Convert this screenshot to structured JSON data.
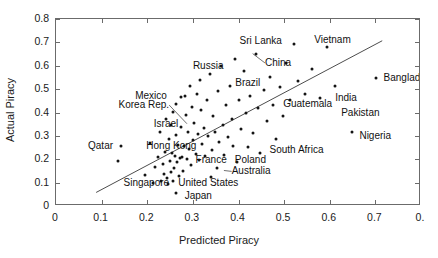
{
  "chart_data": {
    "type": "scatter",
    "title": "",
    "xlabel": "Predicted Piracy",
    "ylabel": "Actual Piracy",
    "xlim": [
      0,
      0.8
    ],
    "ylim": [
      0,
      0.8
    ],
    "xticks": [
      "0",
      "0.1",
      "0.2",
      "0.3",
      "0.4",
      "0.5",
      "0.6",
      "0.7",
      "0."
    ],
    "xtick_values": [
      0,
      0.1,
      0.2,
      0.3,
      0.4,
      0.5,
      0.6,
      0.7,
      0.8
    ],
    "yticks": [
      "0",
      "0.1",
      "0.2",
      "0.3",
      "0.4",
      "0.5",
      "0.6",
      "0.7",
      "0.8"
    ],
    "ytick_values": [
      0,
      0.1,
      0.2,
      0.3,
      0.4,
      0.5,
      0.6,
      0.7,
      0.8
    ],
    "grid": false,
    "legend": "none",
    "marker_color": "#141414",
    "trendline": {
      "label": "fitted-regression-line",
      "color": "#4d4d4d",
      "x0": 0.088,
      "y0": 0.058,
      "x1": 0.715,
      "y1": 0.707
    },
    "points": [
      {
        "x": 0.135,
        "y": 0.193
      },
      {
        "x": 0.143,
        "y": 0.256
      },
      {
        "x": 0.196,
        "y": 0.134
      },
      {
        "x": 0.206,
        "y": 0.269
      },
      {
        "x": 0.212,
        "y": 0.098
      },
      {
        "x": 0.218,
        "y": 0.166
      },
      {
        "x": 0.223,
        "y": 0.208
      },
      {
        "x": 0.228,
        "y": 0.316
      },
      {
        "x": 0.231,
        "y": 0.106
      },
      {
        "x": 0.234,
        "y": 0.178
      },
      {
        "x": 0.236,
        "y": 0.139
      },
      {
        "x": 0.238,
        "y": 0.232
      },
      {
        "x": 0.241,
        "y": 0.372
      },
      {
        "x": 0.243,
        "y": 0.118
      },
      {
        "x": 0.245,
        "y": 0.093
      },
      {
        "x": 0.247,
        "y": 0.287
      },
      {
        "x": 0.249,
        "y": 0.193
      },
      {
        "x": 0.251,
        "y": 0.347
      },
      {
        "x": 0.252,
        "y": 0.145
      },
      {
        "x": 0.254,
        "y": 0.225
      },
      {
        "x": 0.256,
        "y": 0.402
      },
      {
        "x": 0.257,
        "y": 0.108
      },
      {
        "x": 0.259,
        "y": 0.162
      },
      {
        "x": 0.261,
        "y": 0.215
      },
      {
        "x": 0.262,
        "y": 0.438
      },
      {
        "x": 0.263,
        "y": 0.302
      },
      {
        "x": 0.264,
        "y": 0.055
      },
      {
        "x": 0.266,
        "y": 0.188
      },
      {
        "x": 0.268,
        "y": 0.262
      },
      {
        "x": 0.269,
        "y": 0.128
      },
      {
        "x": 0.271,
        "y": 0.205
      },
      {
        "x": 0.273,
        "y": 0.465
      },
      {
        "x": 0.274,
        "y": 0.336
      },
      {
        "x": 0.276,
        "y": 0.211
      },
      {
        "x": 0.278,
        "y": 0.149
      },
      {
        "x": 0.281,
        "y": 0.258
      },
      {
        "x": 0.283,
        "y": 0.471
      },
      {
        "x": 0.285,
        "y": 0.388
      },
      {
        "x": 0.287,
        "y": 0.203
      },
      {
        "x": 0.289,
        "y": 0.318
      },
      {
        "x": 0.291,
        "y": 0.242
      },
      {
        "x": 0.293,
        "y": 0.512
      },
      {
        "x": 0.296,
        "y": 0.175
      },
      {
        "x": 0.298,
        "y": 0.425
      },
      {
        "x": 0.301,
        "y": 0.282
      },
      {
        "x": 0.303,
        "y": 0.355
      },
      {
        "x": 0.306,
        "y": 0.221
      },
      {
        "x": 0.308,
        "y": 0.481
      },
      {
        "x": 0.311,
        "y": 0.308
      },
      {
        "x": 0.313,
        "y": 0.196
      },
      {
        "x": 0.316,
        "y": 0.538
      },
      {
        "x": 0.318,
        "y": 0.412
      },
      {
        "x": 0.321,
        "y": 0.264
      },
      {
        "x": 0.324,
        "y": 0.332
      },
      {
        "x": 0.327,
        "y": 0.212
      },
      {
        "x": 0.331,
        "y": 0.455
      },
      {
        "x": 0.334,
        "y": 0.298
      },
      {
        "x": 0.337,
        "y": 0.565
      },
      {
        "x": 0.339,
        "y": 0.126
      },
      {
        "x": 0.342,
        "y": 0.241
      },
      {
        "x": 0.345,
        "y": 0.385
      },
      {
        "x": 0.348,
        "y": 0.318
      },
      {
        "x": 0.352,
        "y": 0.162
      },
      {
        "x": 0.355,
        "y": 0.492
      },
      {
        "x": 0.358,
        "y": 0.272
      },
      {
        "x": 0.362,
        "y": 0.601
      },
      {
        "x": 0.365,
        "y": 0.348
      },
      {
        "x": 0.368,
        "y": 0.218
      },
      {
        "x": 0.372,
        "y": 0.432
      },
      {
        "x": 0.376,
        "y": 0.295
      },
      {
        "x": 0.381,
        "y": 0.512
      },
      {
        "x": 0.385,
        "y": 0.372
      },
      {
        "x": 0.389,
        "y": 0.258
      },
      {
        "x": 0.392,
        "y": 0.628
      },
      {
        "x": 0.396,
        "y": 0.188
      },
      {
        "x": 0.401,
        "y": 0.455
      },
      {
        "x": 0.405,
        "y": 0.328
      },
      {
        "x": 0.411,
        "y": 0.578
      },
      {
        "x": 0.416,
        "y": 0.398
      },
      {
        "x": 0.421,
        "y": 0.252
      },
      {
        "x": 0.426,
        "y": 0.471
      },
      {
        "x": 0.432,
        "y": 0.312
      },
      {
        "x": 0.438,
        "y": 0.652
      },
      {
        "x": 0.443,
        "y": 0.418
      },
      {
        "x": 0.448,
        "y": 0.225
      },
      {
        "x": 0.455,
        "y": 0.495
      },
      {
        "x": 0.462,
        "y": 0.362
      },
      {
        "x": 0.468,
        "y": 0.552
      },
      {
        "x": 0.475,
        "y": 0.432
      },
      {
        "x": 0.482,
        "y": 0.288
      },
      {
        "x": 0.491,
        "y": 0.508
      },
      {
        "x": 0.498,
        "y": 0.385
      },
      {
        "x": 0.505,
        "y": 0.612
      },
      {
        "x": 0.512,
        "y": 0.452
      },
      {
        "x": 0.522,
        "y": 0.692
      },
      {
        "x": 0.531,
        "y": 0.535
      },
      {
        "x": 0.545,
        "y": 0.478
      },
      {
        "x": 0.562,
        "y": 0.588
      },
      {
        "x": 0.578,
        "y": 0.462
      },
      {
        "x": 0.595,
        "y": 0.682
      },
      {
        "x": 0.612,
        "y": 0.512
      },
      {
        "x": 0.648,
        "y": 0.318
      },
      {
        "x": 0.702,
        "y": 0.548
      }
    ],
    "annotations": [
      {
        "name": "sri-lanka",
        "label": "Sri Lanka",
        "anchor": "right",
        "lx": 0.495,
        "ly": 0.705,
        "px": 0.522,
        "py": 0.692,
        "leader": false
      },
      {
        "name": "vietnam",
        "label": "Vietnam",
        "anchor": "left",
        "lx": 0.566,
        "ly": 0.71,
        "px": 0.595,
        "py": 0.682,
        "leader": false
      },
      {
        "name": "china",
        "label": "China",
        "anchor": "left",
        "lx": 0.458,
        "ly": 0.612,
        "px": 0.431,
        "py": 0.652,
        "leader": true
      },
      {
        "name": "russia",
        "label": "Russia",
        "anchor": "left",
        "lx": 0.3,
        "ly": 0.6,
        "px": 0.362,
        "py": 0.601,
        "leader": false
      },
      {
        "name": "bangladesh",
        "label": "Bangladesh",
        "anchor": "left",
        "lx": 0.718,
        "ly": 0.548,
        "px": 0.702,
        "py": 0.548,
        "leader": false
      },
      {
        "name": "brazil",
        "label": "Brazil",
        "anchor": "left",
        "lx": 0.393,
        "ly": 0.525,
        "px": 0.381,
        "py": 0.548,
        "leader": false
      },
      {
        "name": "mexico",
        "label": "Mexico",
        "anchor": "right",
        "lx": 0.243,
        "ly": 0.472,
        "px": 0.262,
        "py": 0.438,
        "leader": false
      },
      {
        "name": "korea-rep",
        "label": "Korea Rep.",
        "anchor": "right",
        "lx": 0.248,
        "ly": 0.432,
        "px": 0.287,
        "py": 0.352,
        "leader": true
      },
      {
        "name": "guatemala",
        "label": "Guatemala",
        "anchor": "left",
        "lx": 0.498,
        "ly": 0.438,
        "px": 0.482,
        "py": 0.462,
        "leader": false
      },
      {
        "name": "india",
        "label": "India",
        "anchor": "left",
        "lx": 0.612,
        "ly": 0.462,
        "px": 0.595,
        "py": 0.462,
        "leader": false
      },
      {
        "name": "pakistan",
        "label": "Pakistan",
        "anchor": "left",
        "lx": 0.625,
        "ly": 0.398,
        "px": 0.608,
        "py": 0.398,
        "leader": false
      },
      {
        "name": "israel",
        "label": "Israel",
        "anchor": "right",
        "lx": 0.268,
        "ly": 0.352,
        "px": 0.278,
        "py": 0.318,
        "leader": false
      },
      {
        "name": "nigeria",
        "label": "Nigeria",
        "anchor": "left",
        "lx": 0.665,
        "ly": 0.298,
        "px": 0.648,
        "py": 0.318,
        "leader": false
      },
      {
        "name": "qatar",
        "label": "Qatar",
        "anchor": "right",
        "lx": 0.125,
        "ly": 0.258,
        "px": 0.143,
        "py": 0.256,
        "leader": false
      },
      {
        "name": "hong-kong",
        "label": "Hong Kong",
        "anchor": "left",
        "lx": 0.198,
        "ly": 0.258,
        "px": 0.252,
        "py": 0.243,
        "leader": false
      },
      {
        "name": "south-africa",
        "label": "South Africa",
        "anchor": "left",
        "lx": 0.468,
        "ly": 0.24,
        "px": 0.448,
        "py": 0.246,
        "leader": false
      },
      {
        "name": "france",
        "label": "France",
        "anchor": "left",
        "lx": 0.306,
        "ly": 0.196,
        "px": 0.298,
        "py": 0.206,
        "leader": false
      },
      {
        "name": "poland",
        "label": "Poland",
        "anchor": "left",
        "lx": 0.392,
        "ly": 0.196,
        "px": 0.378,
        "py": 0.206,
        "leader": false
      },
      {
        "name": "australia",
        "label": "Australia",
        "anchor": "left",
        "lx": 0.385,
        "ly": 0.148,
        "px": 0.368,
        "py": 0.152,
        "leader": true
      },
      {
        "name": "singapore",
        "label": "Singapore",
        "anchor": "right",
        "lx": 0.248,
        "ly": 0.098,
        "px": 0.258,
        "py": 0.098,
        "leader": false
      },
      {
        "name": "united-states",
        "label": "United States",
        "anchor": "left",
        "lx": 0.268,
        "ly": 0.098,
        "px": 0.261,
        "py": 0.108,
        "leader": false
      },
      {
        "name": "japan",
        "label": "Japan",
        "anchor": "left",
        "lx": 0.282,
        "ly": 0.042,
        "px": 0.264,
        "py": 0.048,
        "leader": false
      }
    ]
  }
}
